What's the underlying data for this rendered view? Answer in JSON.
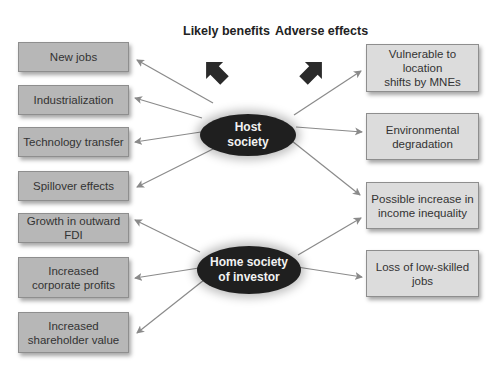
{
  "diagram": {
    "headers": {
      "benefits": "Likely benefits",
      "adverse": "Adverse effects"
    },
    "nodes": {
      "host": "Host society",
      "host_lines": [
        "Host",
        "society"
      ],
      "home": "Home society of investor",
      "home_lines": [
        "Home society",
        "of investor"
      ]
    },
    "benefits": [
      {
        "label": "New jobs",
        "from": "host"
      },
      {
        "label": "Industrialization",
        "from": "host"
      },
      {
        "label": "Technology transfer",
        "from": "host"
      },
      {
        "label": "Spillover effects",
        "from": "host"
      },
      {
        "label": "Growth in outward FDI",
        "from": "home"
      },
      {
        "label": "Increased corporate profits",
        "lines": [
          "Increased",
          "corporate profits"
        ],
        "from": "home"
      },
      {
        "label": "Increased shareholder value",
        "lines": [
          "Increased",
          "shareholder value"
        ],
        "from": "home"
      }
    ],
    "adverse": [
      {
        "label": "Vulnerable to location shifts by MNEs",
        "lines": [
          "Vulnerable to location",
          "shifts by MNEs"
        ],
        "from": "host"
      },
      {
        "label": "Environmental degradation",
        "lines": [
          "Environmental",
          "degradation"
        ],
        "from": "host"
      },
      {
        "label": "Possible increase in income inequality",
        "lines": [
          "Possible increase in",
          "income inequality"
        ],
        "from": [
          "host",
          "home"
        ]
      },
      {
        "label": "Loss of low-skilled jobs",
        "lines": [
          "Loss of low-skilled",
          "jobs"
        ],
        "from": "home"
      }
    ],
    "colors": {
      "oval": "#1f1f1f",
      "left_box": "#b7b7b7",
      "right_box": "#dcdcdc",
      "arrow": "#8a8a8a",
      "block_arrow": "#2a2a2a"
    }
  }
}
